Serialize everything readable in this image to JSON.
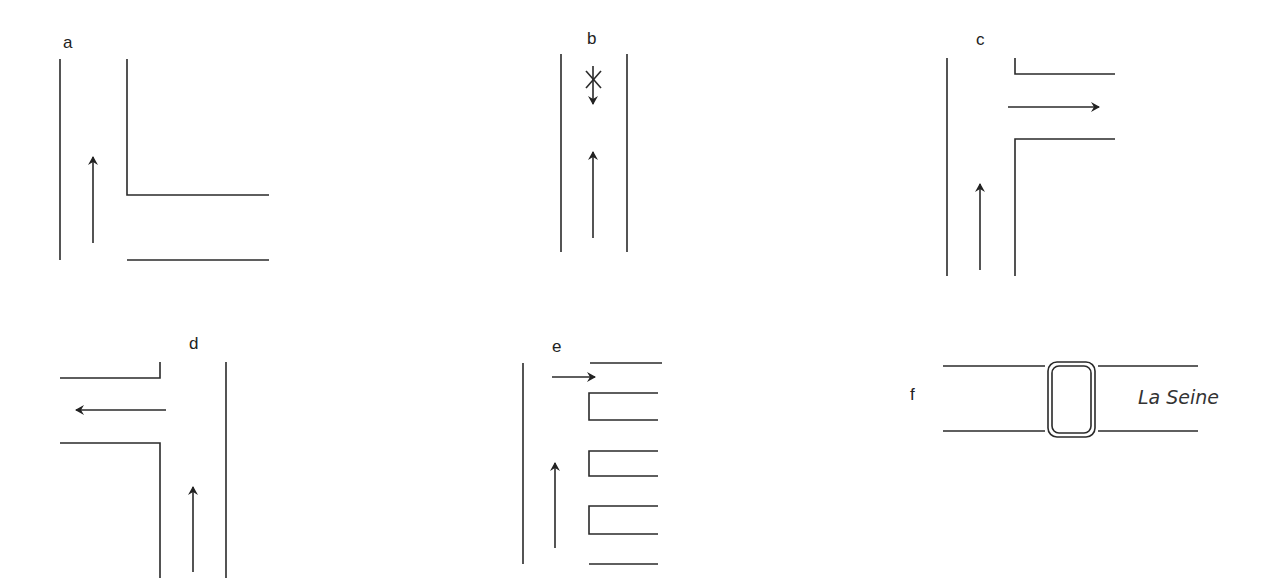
{
  "diagram": {
    "panels": [
      {
        "id": "a",
        "label": "a",
        "description": "Straight road with right-hand side street; arrow pointing straight ahead"
      },
      {
        "id": "b",
        "label": "b",
        "description": "Straight road; arrow straight ahead; crossed-out downward arrow (no entry)"
      },
      {
        "id": "c",
        "label": "c",
        "description": "Road with side street on the right; arrow up then arrow turning right"
      },
      {
        "id": "d",
        "label": "d",
        "description": "Road with side street on the left; arrow up then arrow turning left"
      },
      {
        "id": "e",
        "label": "e",
        "description": "Road with several openings on the right; arrow up and arrow into the top opening (right turn)"
      },
      {
        "id": "f",
        "label": "f",
        "description": "Bridge over river",
        "river_label": "La Seine"
      }
    ]
  }
}
